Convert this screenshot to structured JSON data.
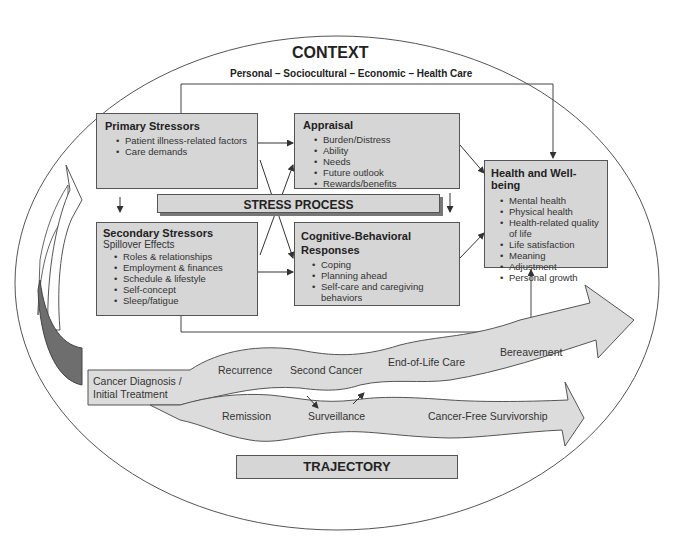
{
  "context": {
    "title": "CONTEXT",
    "subtitle": "Personal – Sociocultural – Economic – Health Care"
  },
  "stress_process": {
    "label": "STRESS PROCESS",
    "primary_stressors": {
      "title": "Primary Stressors",
      "items": [
        "Patient illness-related factors",
        "Care demands"
      ]
    },
    "secondary_stressors": {
      "title": "Secondary Stressors",
      "subtitle": "Spillover Effects",
      "items": [
        "Roles & relationships",
        "Employment & finances",
        "Schedule & lifestyle",
        "Self-concept",
        "Sleep/fatigue"
      ]
    },
    "appraisal": {
      "title": "Appraisal",
      "items": [
        "Burden/Distress",
        "Ability",
        "Needs",
        "Future outlook",
        "Rewards/benefits"
      ]
    },
    "cognitive_behavioral": {
      "title_line1": "Cognitive-Behavioral",
      "title_line2": "Responses",
      "items": [
        "Coping",
        "Planning ahead",
        "Self-care and caregiving behaviors"
      ]
    },
    "health_wellbeing": {
      "title": "Health and Well-being",
      "items": [
        "Mental health",
        "Physical health",
        "Health-related quality",
        "of life",
        "Life satisfaction",
        "Meaning",
        "Adjustment",
        "Personal growth"
      ]
    }
  },
  "trajectory": {
    "label": "TRAJECTORY",
    "start_line1": "Cancer Diagnosis /",
    "start_line2": "Initial Treatment",
    "upper_path": [
      "Recurrence",
      "Second Cancer",
      "End-of-Life Care",
      "Bereavement"
    ],
    "lower_path": [
      "Remission",
      "Surveillance",
      "Cancer-Free Survivorship"
    ]
  },
  "colors": {
    "box_fill": "#d6d6d6",
    "arrow_fill": "#dcdcdc",
    "dark_arrow": "#6e6e6e",
    "line": "#444444"
  }
}
